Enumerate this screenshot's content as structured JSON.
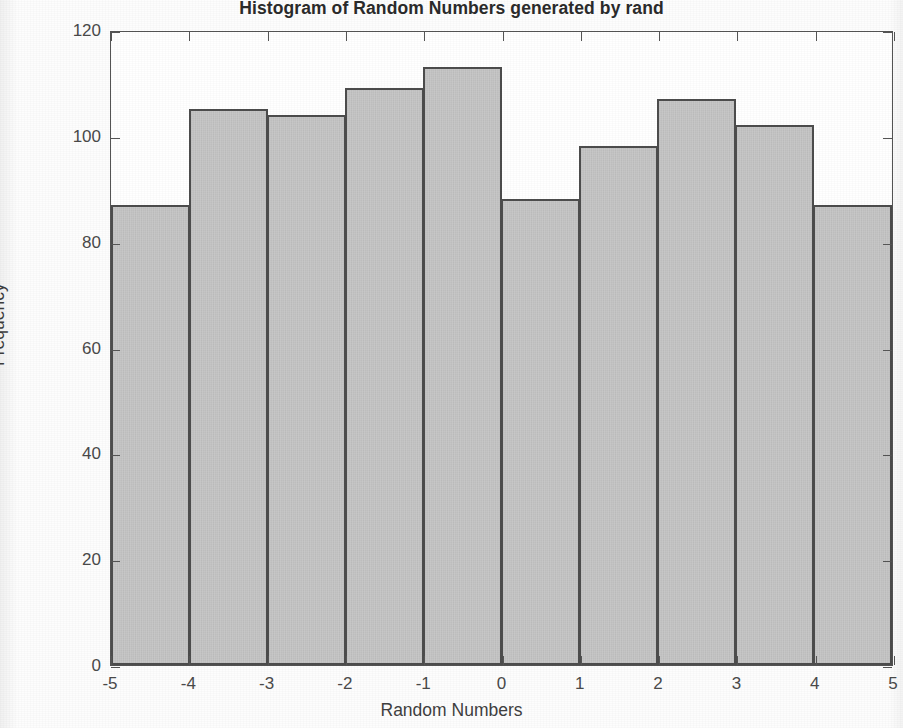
{
  "chart_data": {
    "type": "bar",
    "title": "Histogram of Random Numbers generated by rand",
    "xlabel": "Random Numbers",
    "ylabel": "Frequency",
    "categories": [
      "-5 to -4",
      "-4 to -3",
      "-3 to -2",
      "-2 to -1",
      "-1 to 0",
      "0 to 1",
      "1 to 2",
      "2 to 3",
      "3 to 4",
      "4 to 5"
    ],
    "bin_edges": [
      -5,
      -4,
      -3,
      -2,
      -1,
      0,
      1,
      2,
      3,
      4,
      5
    ],
    "values": [
      87,
      105,
      104,
      109,
      113,
      88,
      98,
      107,
      102,
      87
    ],
    "xlim": [
      -5,
      5
    ],
    "ylim": [
      0,
      120
    ],
    "xticks": [
      -5,
      -4,
      -3,
      -2,
      -1,
      0,
      1,
      2,
      3,
      4,
      5
    ],
    "xtick_labels": [
      "-5",
      "-4",
      "-3",
      "-2",
      "-1",
      "0",
      "1",
      "2",
      "3",
      "4",
      "5"
    ],
    "yticks": [
      0,
      20,
      40,
      60,
      80,
      100,
      120
    ],
    "ytick_labels": [
      "0",
      "20",
      "40",
      "60",
      "80",
      "100",
      "120"
    ],
    "grid": false,
    "legend": null,
    "bar_fill_color": "#c9c9c9",
    "bar_edge_color": "#4d4d4d",
    "axis_color": "#555555",
    "total_count": 1000
  }
}
